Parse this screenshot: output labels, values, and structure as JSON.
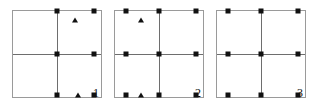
{
  "figure": {
    "panel_count": 3,
    "marker_colors": {
      "square": "#111111",
      "triangle": "#111111",
      "panel_border": "#9a9a9a",
      "grid_line": "#6e6e6e",
      "background": "#ffffff"
    }
  },
  "chart_data": {
    "type": "scatter",
    "title": "",
    "xlabel": "",
    "ylabel": "",
    "xlim": [
      0,
      100
    ],
    "ylim": [
      0,
      100
    ],
    "grid": true,
    "gridlines": {
      "x": [
        50
      ],
      "y": [
        50
      ]
    },
    "legend": "none",
    "panels": [
      {
        "label": "1",
        "series": [
          {
            "name": "square",
            "marker": "square",
            "points": [
              {
                "x": 50,
                "y": 100
              },
              {
                "x": 92,
                "y": 100
              },
              {
                "x": 50,
                "y": 50
              },
              {
                "x": 92,
                "y": 50
              },
              {
                "x": 50,
                "y": 2
              },
              {
                "x": 92,
                "y": 2
              }
            ]
          },
          {
            "name": "triangle",
            "marker": "triangle",
            "points": [
              {
                "x": 70,
                "y": 90
              },
              {
                "x": 74,
                "y": 2
              }
            ]
          }
        ]
      },
      {
        "label": "2",
        "series": [
          {
            "name": "square",
            "marker": "square",
            "points": [
              {
                "x": 12,
                "y": 100
              },
              {
                "x": 50,
                "y": 100
              },
              {
                "x": 92,
                "y": 100
              },
              {
                "x": 12,
                "y": 50
              },
              {
                "x": 50,
                "y": 50
              },
              {
                "x": 92,
                "y": 50
              },
              {
                "x": 12,
                "y": 2
              },
              {
                "x": 50,
                "y": 2
              },
              {
                "x": 92,
                "y": 2
              }
            ]
          },
          {
            "name": "triangle",
            "marker": "triangle",
            "points": [
              {
                "x": 30,
                "y": 90
              },
              {
                "x": 30,
                "y": 2
              }
            ]
          }
        ]
      },
      {
        "label": "3",
        "series": [
          {
            "name": "square",
            "marker": "square",
            "points": [
              {
                "x": 12,
                "y": 100
              },
              {
                "x": 50,
                "y": 100
              },
              {
                "x": 92,
                "y": 100
              },
              {
                "x": 12,
                "y": 50
              },
              {
                "x": 50,
                "y": 50
              },
              {
                "x": 92,
                "y": 50
              },
              {
                "x": 12,
                "y": 2
              },
              {
                "x": 50,
                "y": 2
              },
              {
                "x": 92,
                "y": 2
              }
            ]
          },
          {
            "name": "triangle",
            "marker": "triangle",
            "points": []
          }
        ]
      }
    ]
  }
}
